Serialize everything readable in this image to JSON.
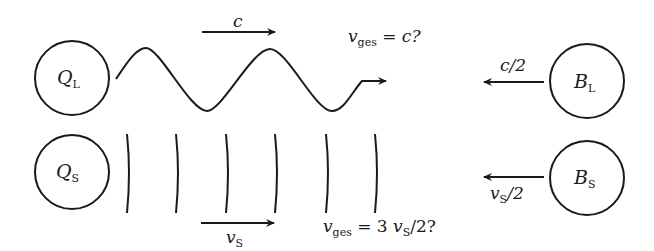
{
  "diagram": {
    "colors": {
      "stroke": "#1a1a1a",
      "background": "#ffffff"
    },
    "top_row": {
      "source": {
        "symbol": "Q",
        "subscript": "L"
      },
      "observer": {
        "symbol": "B",
        "subscript": "L"
      },
      "wave_type": "sine-wave",
      "wave_speed_label": {
        "symbol": "c"
      },
      "observer_speed_label": {
        "text": "c/2"
      },
      "question": {
        "lhs": "v",
        "lhs_sub": "ges",
        "rhs": "= c?"
      }
    },
    "bottom_row": {
      "source": {
        "symbol": "Q",
        "subscript": "S"
      },
      "observer": {
        "symbol": "B",
        "subscript": "S"
      },
      "wave_type": "wavefronts",
      "wavefront_count": 6,
      "wave_speed_label": {
        "symbol": "v",
        "subscript": "S"
      },
      "observer_speed_label": {
        "symbol": "v",
        "subscript": "S",
        "suffix": "/2"
      },
      "question": {
        "lhs": "v",
        "lhs_sub": "ges",
        "rhs_pre": "= 3 ",
        "rhs_sym": "v",
        "rhs_sub": "S",
        "rhs_post": "/2?"
      }
    }
  }
}
